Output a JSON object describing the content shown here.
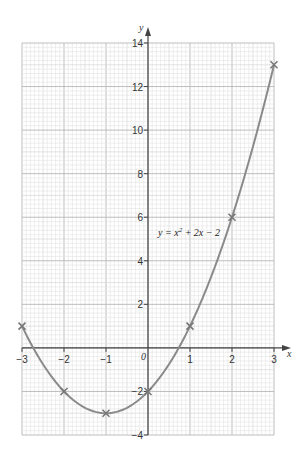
{
  "chart_data": {
    "type": "line",
    "title": "",
    "equation_label": "y = x² + 2x − 2",
    "xlabel": "x",
    "ylabel": "y",
    "xlim": [
      -3,
      3
    ],
    "ylim": [
      -4,
      14
    ],
    "x_ticks": [
      -3,
      -2,
      -1,
      0,
      1,
      2,
      3
    ],
    "y_ticks": [
      -4,
      -2,
      2,
      4,
      6,
      8,
      10,
      12,
      14
    ],
    "origin_label": "0",
    "grid": true,
    "x": [
      -3,
      -2,
      -1,
      0,
      1,
      2,
      3
    ],
    "series": [
      {
        "name": "y = x^2 + 2x - 2",
        "values": [
          1,
          -2,
          -3,
          -2,
          1,
          6,
          13
        ],
        "marker": "x"
      }
    ],
    "colors": {
      "curve": "#8a8a8a",
      "grid_major": "#bdbdbd",
      "grid_minor": "#e2e2e2",
      "axis": "#444444"
    }
  }
}
